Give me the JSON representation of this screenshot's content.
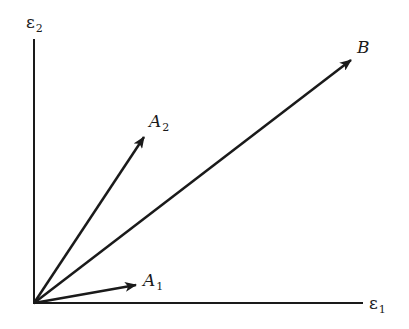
{
  "diagram": {
    "type": "vector-diagram",
    "axes": {
      "x": {
        "label_symbol": "ε",
        "label_sub": "1"
      },
      "y": {
        "label_symbol": "ε",
        "label_sub": "2"
      }
    },
    "vectors": [
      {
        "id": "A1",
        "label_symbol": "A",
        "label_sub": "1"
      },
      {
        "id": "A2",
        "label_symbol": "A",
        "label_sub": "2"
      },
      {
        "id": "B",
        "label_symbol": "B",
        "label_sub": ""
      }
    ],
    "colors": {
      "ink": "#1a1a1a",
      "background": "#ffffff"
    }
  }
}
